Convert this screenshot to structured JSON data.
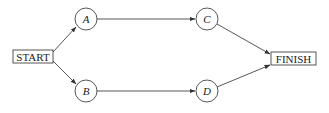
{
  "diagram": {
    "type": "network",
    "start": {
      "label": "START",
      "x": 13,
      "y": 50,
      "w": 40,
      "h": 13
    },
    "finish": {
      "label": "FINISH",
      "x": 271,
      "y": 52,
      "w": 45,
      "h": 13
    },
    "nodes": [
      {
        "id": "A",
        "label": "A",
        "cx": 86,
        "cy": 19,
        "r": 11
      },
      {
        "id": "B",
        "label": "B",
        "cx": 86,
        "cy": 91,
        "r": 11
      },
      {
        "id": "C",
        "label": "C",
        "cx": 207,
        "cy": 19,
        "r": 11
      },
      {
        "id": "D",
        "label": "D",
        "cx": 207,
        "cy": 91,
        "r": 11
      }
    ],
    "edges": [
      {
        "from": "START",
        "to": "A"
      },
      {
        "from": "START",
        "to": "B"
      },
      {
        "from": "A",
        "to": "C"
      },
      {
        "from": "B",
        "to": "D"
      },
      {
        "from": "C",
        "to": "FINISH"
      },
      {
        "from": "D",
        "to": "FINISH"
      }
    ]
  }
}
